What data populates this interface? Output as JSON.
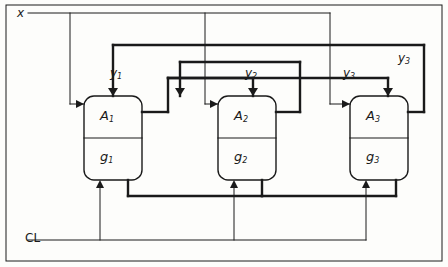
{
  "figure": {
    "background": "#fdfdfb",
    "line_color": "#1a1a1a"
  },
  "labels": {
    "input_x": "x",
    "clock": "CL",
    "outputs": [
      {
        "name": "y1",
        "base": "y",
        "sub": "1"
      },
      {
        "name": "y2",
        "base": "y",
        "sub": "2"
      },
      {
        "name": "y3",
        "base": "y",
        "sub": "3"
      }
    ]
  },
  "blocks": [
    {
      "id": "block-1",
      "top_base": "A",
      "top_sub": "1",
      "bottom_base": "g",
      "bottom_sub": "1"
    },
    {
      "id": "block-2",
      "top_base": "A",
      "top_sub": "2",
      "bottom_base": "g",
      "bottom_sub": "2"
    },
    {
      "id": "block-3",
      "top_base": "A",
      "top_sub": "3",
      "bottom_base": "g",
      "bottom_sub": "3"
    }
  ]
}
